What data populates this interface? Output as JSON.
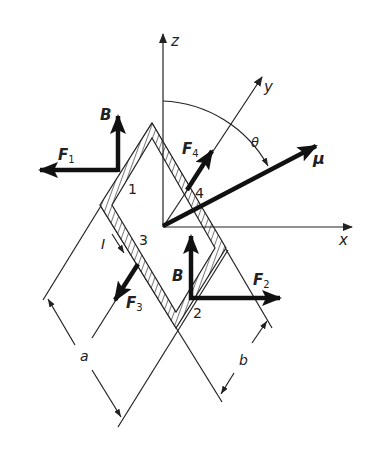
{
  "figure": {
    "axes": {
      "z_label": "z",
      "y_label": "y",
      "x_label": "x"
    },
    "angle_label": "θ",
    "moment_label": "μ",
    "field_labels": [
      "B",
      "B"
    ],
    "current_label": "I",
    "forces": [
      {
        "label": "F",
        "sub": "1"
      },
      {
        "label": "F",
        "sub": "2"
      },
      {
        "label": "F",
        "sub": "3"
      },
      {
        "label": "F",
        "sub": "4"
      }
    ],
    "sides": [
      "1",
      "2",
      "3",
      "4"
    ],
    "dimensions": {
      "a_label": "a",
      "b_label": "b"
    },
    "colors": {
      "ink": "#222222",
      "background": "#ffffff"
    }
  }
}
